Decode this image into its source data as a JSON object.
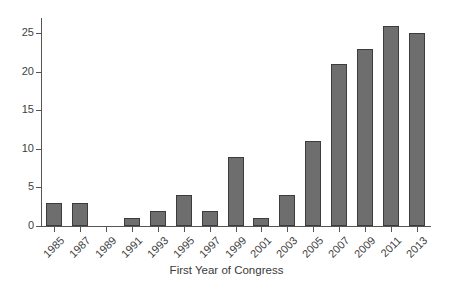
{
  "chart_data": {
    "type": "bar",
    "title": "",
    "subtitle": "",
    "xlabel": "First Year of Congress",
    "ylabel": "",
    "categories": [
      "1985",
      "1987",
      "1989",
      "1991",
      "1993",
      "1995",
      "1997",
      "1999",
      "2001",
      "2003",
      "2005",
      "2007",
      "2009",
      "2011",
      "2013"
    ],
    "values": [
      3,
      3,
      0,
      1,
      2,
      4,
      2,
      9,
      1,
      4,
      11,
      21,
      23,
      26,
      25
    ],
    "series": [
      {
        "name": "count",
        "values": [
          3,
          3,
          0,
          1,
          2,
          4,
          2,
          9,
          1,
          4,
          11,
          21,
          23,
          26,
          25
        ]
      }
    ],
    "ylim": [
      0,
      27
    ],
    "xlim_categorical": true,
    "y_ticks": [
      0,
      5,
      10,
      15,
      20,
      25
    ],
    "y_tick_labels": [
      "0",
      "5",
      "10",
      "15",
      "20",
      "25"
    ],
    "x_tick_labels": [
      "1985",
      "1987",
      "1989",
      "1991",
      "1993",
      "1995",
      "1997",
      "1999",
      "2001",
      "2003",
      "2005",
      "2007",
      "2009",
      "2011",
      "2013"
    ],
    "x_tick_label_rotation_deg": -45,
    "grid": false,
    "legend": null,
    "legend_position": "none",
    "annotations": [],
    "bar_fill_color": "#6e6e6e",
    "bar_edge_color": "#3c3c3c",
    "axis_color": "#555555",
    "text_color": "#3a3a3a",
    "background_color": "#ffffff"
  }
}
